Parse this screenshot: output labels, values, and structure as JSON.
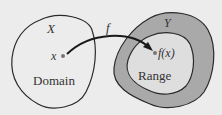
{
  "diagram": {
    "domain_set_label": "X",
    "codomain_set_label": "Y",
    "function_label": "f",
    "point_label": "x",
    "image_label": "f(x)",
    "domain_label": "Domain",
    "range_label": "Range",
    "colors": {
      "background": "#ececec",
      "codomain_fill": "#a9a9a9",
      "range_fill": "#dedede",
      "stroke": "#2a2a2a"
    }
  }
}
